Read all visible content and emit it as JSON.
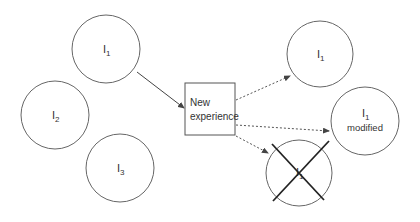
{
  "diagram": {
    "left_ideas": [
      {
        "id": "I1",
        "base": "I",
        "sub": "1",
        "cx": 106,
        "cy": 49
      },
      {
        "id": "I2",
        "base": "I",
        "sub": "2",
        "cx": 55,
        "cy": 115
      },
      {
        "id": "I3",
        "base": "I",
        "sub": "3",
        "cx": 120,
        "cy": 168
      }
    ],
    "box": {
      "line1": "New",
      "line2": "experience"
    },
    "outcomes": [
      {
        "id": "kept",
        "base": "I",
        "sub": "1",
        "caption": ""
      },
      {
        "id": "modified",
        "base": "I",
        "sub": "1",
        "caption": "modified"
      },
      {
        "id": "rejected",
        "base": "I",
        "sub": "1",
        "caption": "",
        "crossed": true
      }
    ],
    "colors": {
      "stroke": "#555555",
      "cross": "#222222",
      "background": "#ffffff"
    }
  }
}
